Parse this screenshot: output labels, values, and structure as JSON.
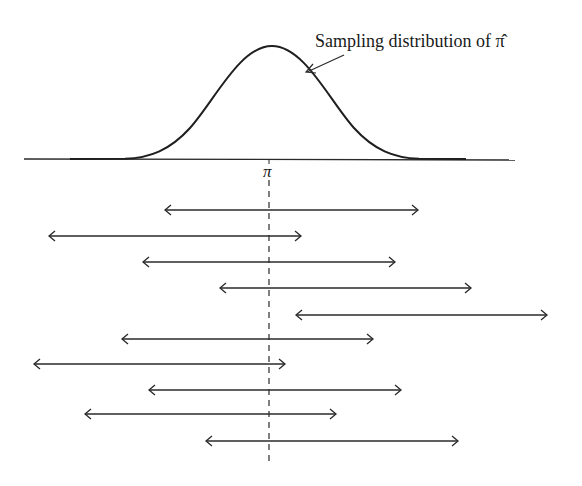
{
  "diagram": {
    "title_annotation": "Sampling distribution of π̂",
    "axis_label": "π",
    "colors": {
      "ink": "#2a2a2a",
      "background": "#ffffff"
    },
    "axis": {
      "x1": 24,
      "x2": 515,
      "y": 159
    },
    "center_x": 269,
    "dashed_line": {
      "y1": 162,
      "y2": 464
    },
    "intervals": [
      {
        "left": 165,
        "right": 418,
        "y": 210
      },
      {
        "left": 49,
        "right": 301,
        "y": 236
      },
      {
        "left": 143,
        "right": 395,
        "y": 262
      },
      {
        "left": 220,
        "right": 471,
        "y": 288
      },
      {
        "left": 296,
        "right": 547,
        "y": 315
      },
      {
        "left": 122,
        "right": 373,
        "y": 339
      },
      {
        "left": 34,
        "right": 285,
        "y": 364
      },
      {
        "left": 149,
        "right": 401,
        "y": 390
      },
      {
        "left": 85,
        "right": 336,
        "y": 414
      },
      {
        "left": 206,
        "right": 458,
        "y": 441
      }
    ]
  }
}
